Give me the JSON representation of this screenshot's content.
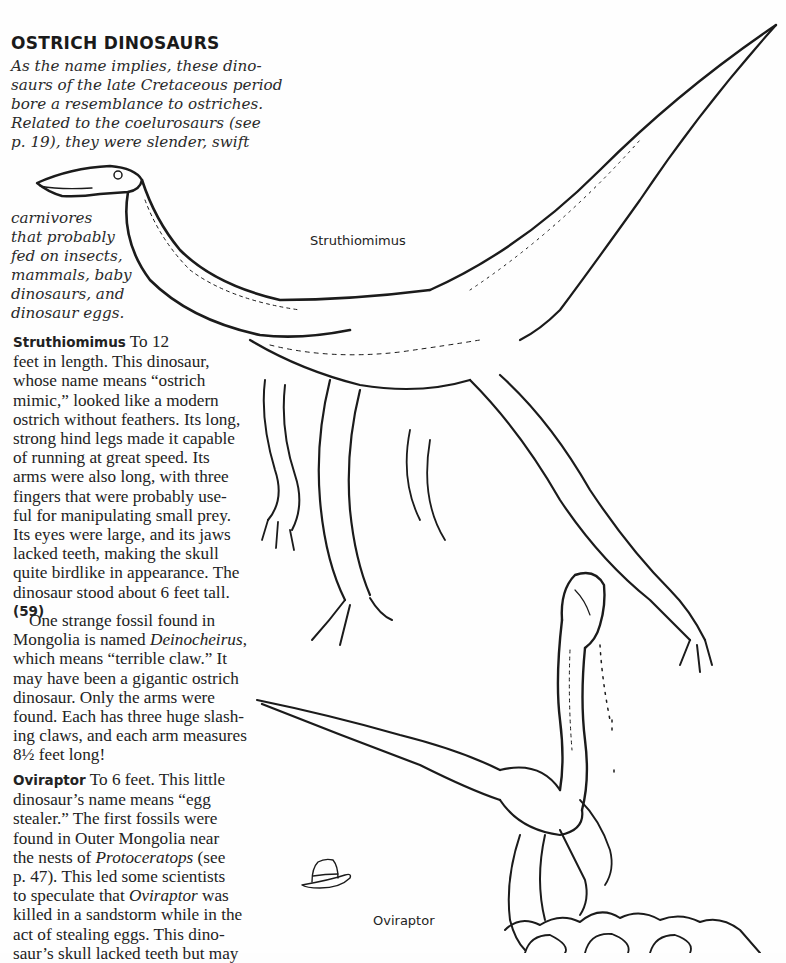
{
  "title": "OSTRICH DINOSAURS",
  "intro": {
    "lines": [
      "As the name implies, these dino-",
      "saurs of the late Cretaceous period",
      "bore a resemblance to ostriches.",
      "Related to the coelurosaurs (see",
      "p. 19), they were slender, swift"
    ],
    "continued": [
      "carnivores",
      "that probably",
      "fed on insects,",
      "mammals, baby",
      "dinosaurs, and",
      "dinosaur eggs."
    ]
  },
  "struthiomimus": {
    "heading": "Struthiomimus",
    "first_line": " To 12",
    "lines": [
      "feet in length. This dinosaur,",
      "whose name means “ostrich",
      "mimic,” looked like a modern",
      "ostrich without feathers. Its long,",
      "strong hind legs made it capable",
      "of running at great speed. Its",
      "arms were also long, with three",
      "fingers that were probably use-",
      "ful for manipulating small prey.",
      "Its eyes were large, and its jaws",
      "lacked teeth, making the skull",
      "quite birdlike in appearance. The",
      "dinosaur stood about 6 feet tall."
    ],
    "ref": "(59)"
  },
  "deinocheirus": {
    "line1": "One strange fossil found in",
    "line2_pre": "Mongolia is named ",
    "line2_em": "Deinocheirus",
    "line2_post": ",",
    "lines": [
      "which means “terrible claw.” It",
      "may have been a gigantic ostrich",
      "dinosaur. Only the arms were",
      "found. Each has three huge slash-",
      "ing claws, and each arm measures",
      "8½ feet long!"
    ]
  },
  "oviraptor": {
    "heading": "Oviraptor",
    "first_line": " To 6 feet. This little",
    "lines": [
      "dinosaur’s name means “egg",
      "stealer.” The first fossils were",
      "found in Outer Mongolia near"
    ],
    "line5_pre": "the nests of ",
    "line5_em": "Protoceratops",
    "line5_post": " (see",
    "line6": "p. 47). This led some scientists",
    "line7_pre": "to speculate that ",
    "line7_em": "Oviraptor",
    "line7_post": " was",
    "lines2": [
      "killed in a sandstorm while in the",
      "act of stealing eggs. This dino-",
      "saur’s skull lacked teeth but may"
    ]
  },
  "illustrations": {
    "struthiomimus_label": "Struthiomimus",
    "oviraptor_label": "Oviraptor",
    "hat_icon": "fedora-hat-icon"
  }
}
